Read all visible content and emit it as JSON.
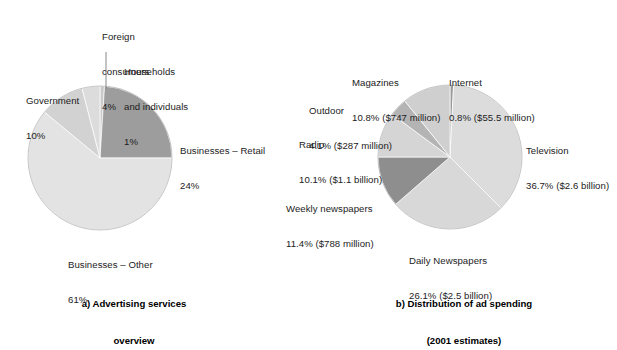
{
  "figure": {
    "background": "#ffffff",
    "text_color": "#1c1c1c"
  },
  "chart_data": [
    {
      "type": "pie",
      "id": "advertising-services-overview",
      "title": "a) Advertising services overview",
      "title_line1": "a) Advertising services",
      "title_line2": "overview",
      "start_angle_deg": 0,
      "direction": "clockwise",
      "unit": "percent",
      "categories": [
        "Households and individuals",
        "Businesses – Retail",
        "Businesses – Other",
        "Government",
        "Foreign consumers"
      ],
      "values": [
        1,
        24,
        61,
        10,
        4
      ],
      "colors": [
        "#c9c9c9",
        "#9d9d9d",
        "#e3e3e3",
        "#d2d2d2",
        "#dcdcdc"
      ],
      "labels": [
        {
          "name": "households",
          "line1": "Households",
          "line2": "and individuals",
          "line3": "1%"
        },
        {
          "name": "businesses-retail",
          "line1": "Businesses – Retail",
          "line2": "24%"
        },
        {
          "name": "businesses-other",
          "line1": "Businesses – Other",
          "line2": "61%"
        },
        {
          "name": "government",
          "line1": "Government",
          "line2": "10%"
        },
        {
          "name": "foreign-consumers",
          "line1": "Foreign",
          "line2": "consumers",
          "line3": "4%"
        }
      ],
      "leader_lines": 1,
      "grid": false,
      "legend": "none"
    },
    {
      "type": "pie",
      "id": "distribution-of-ad-spending",
      "title": "b) Distribution of ad spending (2001 estimates)",
      "title_line1": "b) Distribution of ad spending",
      "title_line2": "(2001 estimates)",
      "start_angle_deg": 0,
      "direction": "clockwise",
      "unit": "percent",
      "categories": [
        "Internet",
        "Television",
        "Daily Newspapers",
        "Weekly newspapers",
        "Radio",
        "Outdoor",
        "Magazines"
      ],
      "values": [
        0.8,
        36.7,
        26.1,
        11.4,
        10.1,
        4.1,
        10.8
      ],
      "amounts": [
        "$55.5 million",
        "$2.6 billion",
        "$2.5 billion",
        "$788 million",
        "$1.1 billion",
        "$287 million",
        "$747 million"
      ],
      "colors": [
        "#9a9a9a",
        "#dcdcdc",
        "#d8d8d8",
        "#8e8e8e",
        "#d5d5d5",
        "#b4b4b4",
        "#cfcfcf"
      ],
      "labels": [
        {
          "name": "internet",
          "line1": "Internet",
          "line2": "0.8% ($55.5 million)"
        },
        {
          "name": "television",
          "line1": "Television",
          "line2": "36.7% ($2.6 billion)"
        },
        {
          "name": "daily-newspapers",
          "line1": "Daily Newspapers",
          "line2": "26.1% ($2.5 billion)"
        },
        {
          "name": "weekly-newspapers",
          "line1": "Weekly newspapers",
          "line2": "11.4% ($788 million)"
        },
        {
          "name": "radio",
          "line1": "Radio",
          "line2": "10.1% ($1.1 billion)"
        },
        {
          "name": "outdoor",
          "line1": "Outdoor",
          "line2": "4.1% ($287 million)"
        },
        {
          "name": "magazines",
          "line1": "Magazines",
          "line2": "10.8% ($747 million)"
        }
      ],
      "grid": false,
      "legend": "none"
    }
  ],
  "panel_a": {
    "caption_line1": "a) Advertising services",
    "caption_line2": "overview",
    "labels": {
      "foreign_consumers": {
        "l1": "Foreign",
        "l2": "consumers",
        "l3": "4%"
      },
      "households": {
        "l1": "Households",
        "l2": "and individuals",
        "l3": "1%"
      },
      "government": {
        "l1": "Government",
        "l2": "10%"
      },
      "businesses_retail": {
        "l1": "Businesses – Retail",
        "l2": "24%"
      },
      "businesses_other": {
        "l1": "Businesses – Other",
        "l2": "61%"
      }
    }
  },
  "panel_b": {
    "caption_line1": "b) Distribution of ad spending",
    "caption_line2": "(2001 estimates)",
    "labels": {
      "magazines": {
        "l1": "Magazines",
        "l2": "10.8% ($747 million)"
      },
      "internet": {
        "l1": "Internet",
        "l2": "0.8% ($55.5 million)"
      },
      "outdoor": {
        "l1": "Outdoor",
        "l2": "4.1% ($287 million)"
      },
      "radio": {
        "l1": "Radio",
        "l2": "10.1% ($1.1 billion)"
      },
      "weekly_newspapers": {
        "l1": "Weekly newspapers",
        "l2": "11.4% ($788 million)"
      },
      "daily_newspapers": {
        "l1": "Daily Newspapers",
        "l2": "26.1% ($2.5 billion)"
      },
      "television": {
        "l1": "Television",
        "l2": "36.7% ($2.6 billion)"
      }
    }
  }
}
